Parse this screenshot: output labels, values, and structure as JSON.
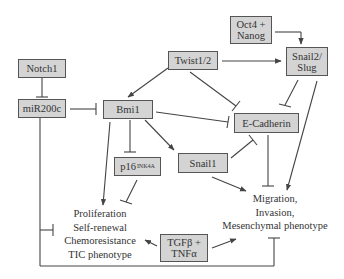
{
  "diagram": {
    "type": "signaling-pathway",
    "colors": {
      "node_fill": "#d4d4d4",
      "node_border": "#555555",
      "edge": "#444444",
      "text": "#333333",
      "background": "#ffffff"
    },
    "nodes": {
      "notch1": {
        "label": "Notch1"
      },
      "mir200c": {
        "label": "miR200c"
      },
      "bmi1": {
        "label": "Bmi1"
      },
      "twist": {
        "label": "Twist1/2"
      },
      "oct4_nanog": {
        "line1": "Oct4 +",
        "line2": "Nanog"
      },
      "snail2": {
        "line1": "Snail2/",
        "line2": "Slug"
      },
      "ecadherin": {
        "label": "E-Cadherin"
      },
      "p16": {
        "label": "p16",
        "superscript": "INK4A"
      },
      "snail1": {
        "label": "Snail1"
      },
      "tgfb_tnfa": {
        "line1": "TGFβ +",
        "line2": "TNFα"
      }
    },
    "outcomes": {
      "stemness": {
        "lines": [
          "Proliferation",
          "Self-renewal",
          "Chemoresistance",
          "TIC phenotype"
        ]
      },
      "emt": {
        "lines": [
          "Migration,",
          "Invasion,",
          "Mesenchymal phenotype"
        ]
      }
    },
    "edges": [
      {
        "from": "Notch1",
        "to": "miR200c",
        "type": "inhibition"
      },
      {
        "from": "miR200c",
        "to": "Bmi1",
        "type": "inhibition"
      },
      {
        "from": "miR200c",
        "to": "Proliferation/Self-renewal/Chemoresistance/TIC phenotype",
        "type": "inhibition"
      },
      {
        "from": "miR200c",
        "to": "Migration/Invasion/Mesenchymal phenotype",
        "type": "inhibition"
      },
      {
        "from": "Twist1/2",
        "to": "Bmi1",
        "type": "activation"
      },
      {
        "from": "Twist1/2",
        "to": "Snail2/Slug",
        "type": "activation"
      },
      {
        "from": "Twist1/2",
        "to": "E-Cadherin",
        "type": "inhibition"
      },
      {
        "from": "Oct4 + Nanog",
        "to": "Snail2/Slug",
        "type": "activation"
      },
      {
        "from": "Snail2/Slug",
        "to": "E-Cadherin",
        "type": "inhibition"
      },
      {
        "from": "Snail2/Slug",
        "to": "Migration/Invasion/Mesenchymal phenotype",
        "type": "activation"
      },
      {
        "from": "Bmi1",
        "to": "E-Cadherin",
        "type": "inhibition"
      },
      {
        "from": "Bmi1",
        "to": "p16INK4A",
        "type": "inhibition"
      },
      {
        "from": "Bmi1",
        "to": "Snail1",
        "type": "activation"
      },
      {
        "from": "Bmi1",
        "to": "Proliferation/Self-renewal/Chemoresistance/TIC phenotype",
        "type": "activation"
      },
      {
        "from": "p16INK4A",
        "to": "Proliferation/Self-renewal/Chemoresistance/TIC phenotype",
        "type": "inhibition"
      },
      {
        "from": "Snail1",
        "to": "E-Cadherin",
        "type": "inhibition"
      },
      {
        "from": "Snail1",
        "to": "Migration/Invasion/Mesenchymal phenotype",
        "type": "activation"
      },
      {
        "from": "E-Cadherin",
        "to": "Migration/Invasion/Mesenchymal phenotype",
        "type": "inhibition"
      },
      {
        "from": "TGFβ + TNFα",
        "to": "Proliferation/Self-renewal/Chemoresistance/TIC phenotype",
        "type": "activation"
      },
      {
        "from": "TGFβ + TNFα",
        "to": "Migration/Invasion/Mesenchymal phenotype",
        "type": "activation"
      }
    ]
  }
}
